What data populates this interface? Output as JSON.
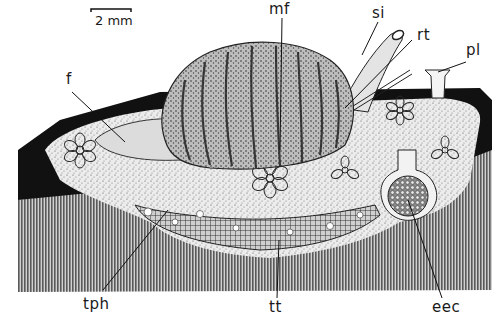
{
  "figure": {
    "type": "scientific illustration",
    "scale_bar": {
      "label": "2 mm"
    },
    "labels": [
      {
        "id": "mf",
        "text": "mf"
      },
      {
        "id": "si",
        "text": "si"
      },
      {
        "id": "rt",
        "text": "rt"
      },
      {
        "id": "pl",
        "text": "pl"
      },
      {
        "id": "f",
        "text": "f"
      },
      {
        "id": "tph",
        "text": "tph"
      },
      {
        "id": "tt",
        "text": "tt"
      },
      {
        "id": "eec",
        "text": "eec"
      }
    ],
    "colors": {
      "ink": "#1a1a1a",
      "dark_band": "#111111",
      "hatched_base": "#7a7a7a",
      "tissue_light": "#e6e6e6",
      "shell": "#9a9a9a",
      "paper": "#ffffff"
    }
  }
}
